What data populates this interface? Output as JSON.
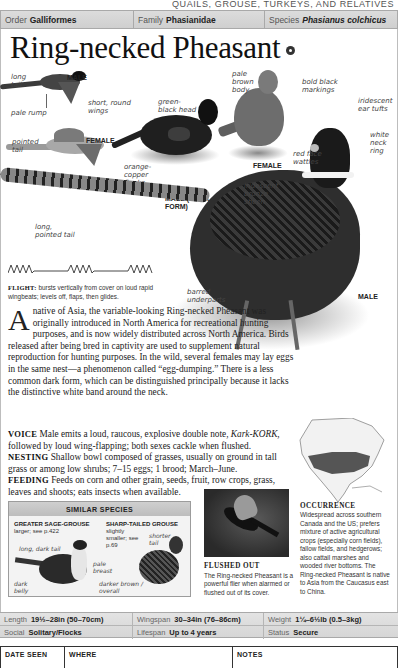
{
  "section_title": "QUAILS, GROUSE, TURKEYS, AND RELATIVES",
  "taxonomy": {
    "order_label": "Order",
    "order_value": "Galliformes",
    "family_label": "Family",
    "family_value": "Phasianidae",
    "species_label": "Species",
    "species_value": "Phasianus colchicus"
  },
  "title": "Ring-necked Pheasant",
  "audio_icon": "audio-icon",
  "illustration_labels": {
    "long_tail": "long tail",
    "male_flight": "MALE",
    "pale_rump": "pale rump",
    "short_round_wings": "short, round wings",
    "pointed_tail": "pointed tail",
    "female_flight": "FEMALE",
    "in_flight": "IN FLIGHT",
    "green_black_head": "green-black head",
    "orange_copper_flanks": "orange-copper flanks",
    "male_dark_form": "MALE (DARK FORM)",
    "pale_brown_body": "pale brown body",
    "bold_black_markings": "bold black markings",
    "female": "FEMALE",
    "red_face_wattles": "red face wattles",
    "iridescent_ear_tufts": "iridescent ear tufts",
    "white_neck_ring": "white neck ring",
    "iridescent_bronze_sheen": "iridescent bronze sheen",
    "long_pointed_tail": "long, pointed tail",
    "barred_underparts": "barred underparts",
    "male": "MALE"
  },
  "flight": {
    "label": "FLIGHT:",
    "text": "bursts vertically from cover on loud rapid wingbeats; levels off, flaps, then glides."
  },
  "description": {
    "dropcap": "A",
    "intro": "native of Asia, the variable-looking Ring-necked Pheasant was originally introduced in North America for recreational hunting purposes, and is now widely distributed across North America. Birds released after being bred in captivity are used to supplement natural reproduction for hunting purposes. In the wild, several females may lay eggs in the same nest—a phenomenon called “egg-dumping.” There is a less common dark form, which can be distinguished principally because it lacks the distinctive white band around the neck.",
    "voice_label": "VOICE",
    "voice_text_1": "Male emits a loud, raucous, explosive double note,",
    "voice_call": "Kark-KORK,",
    "voice_text_2": "followed by loud wing-flapping; both sexes cackle when flushed.",
    "nesting_label": "NESTING",
    "nesting_text": "Shallow bowl composed of grasses, usually on ground in tall grass or among low shrubs; 7–15 eggs; 1 brood; March–June.",
    "feeding_label": "FEEDING",
    "feeding_text": "Feeds on corn and other grain, seeds, fruit, row crops, grass, leaves and shoots; eats insects when available."
  },
  "similar_species": {
    "heading": "SIMILAR SPECIES",
    "species": [
      {
        "name": "GREATER SAGE-GROUSE",
        "note": "larger; see p.422",
        "labels": [
          "long, dark tail",
          "pale breast",
          "dark belly"
        ]
      },
      {
        "name": "SHARP-TAILED GROUSE",
        "note": "slightly smaller; see p.69",
        "labels": [
          "shorter tail",
          "darker brown / overall"
        ]
      }
    ]
  },
  "photo": {
    "title": "FLUSHED OUT",
    "caption": "The Ring-necked Pheasant is a powerful flier when alarmed or flushed out of its cover."
  },
  "occurrence": {
    "title": "OCCURRENCE",
    "text": "Widespread across southern Canada and the US; prefers mixture of active agricultural crops (especially corn fields), fallow fields, and hedgerows; also cattail marshes and wooded river bottoms. The Ring-necked Pheasant is native to Asia from the Caucasus east to China."
  },
  "stats": {
    "length_label": "Length",
    "length_value": "19½–28in (50–70cm)",
    "wingspan_label": "Wingspan",
    "wingspan_value": "30–34in (76–86cm)",
    "weight_label": "Weight",
    "weight_value": "1¼–6½lb (0.5–3kg)",
    "social_label": "Social",
    "social_value": "Solitary/Flocks",
    "lifespan_label": "Lifespan",
    "lifespan_value": "Up to 4 years",
    "status_label": "Status",
    "status_value": "Secure"
  },
  "log": {
    "columns": [
      "DATE SEEN",
      "WHERE",
      "NOTES"
    ]
  }
}
